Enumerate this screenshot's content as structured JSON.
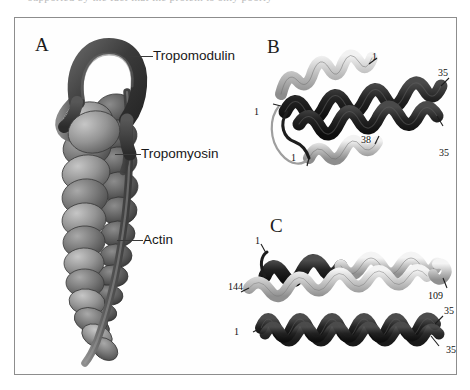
{
  "page": {
    "top_cut_text": "supported by the fact that the protein is only poorly",
    "background_color": "#ffffff",
    "frame_border_color": "#8d8d8d"
  },
  "figure": {
    "panels": [
      {
        "id": "A",
        "letter": "A",
        "description": "Actin filament capped by tropomodulin with tropomyosin strand",
        "callouts": [
          {
            "name": "tropomodulin",
            "label": "Tropomodulin"
          },
          {
            "name": "tropomyosin",
            "label": "Tropomyosin"
          },
          {
            "name": "actin",
            "label": "Actin"
          }
        ]
      },
      {
        "id": "B",
        "letter": "B",
        "description": "Coiled-coil ribbon model, N-terminal region",
        "residue_labels": [
          {
            "name": "b-top-helix-start",
            "text": "1"
          },
          {
            "name": "b-left-chain-start",
            "text": "1"
          },
          {
            "name": "b-lower-helix-start",
            "text": "1"
          },
          {
            "name": "b-lower-helix-end",
            "text": "38"
          },
          {
            "name": "b-upper-right-end",
            "text": "35"
          },
          {
            "name": "b-lower-right-end",
            "text": "35"
          }
        ]
      },
      {
        "id": "C",
        "letter": "C",
        "description": "Coiled-coil ribbon model, second construct",
        "residue_labels": [
          {
            "name": "c-upper-left-start",
            "text": "1"
          },
          {
            "name": "c-upper-left-end",
            "text": "144"
          },
          {
            "name": "c-upper-right-end",
            "text": "109"
          },
          {
            "name": "c-lower-left-start",
            "text": "1"
          },
          {
            "name": "c-lower-right-upper",
            "text": "35"
          },
          {
            "name": "c-lower-right-lower",
            "text": "35"
          }
        ]
      }
    ],
    "colors": {
      "dark_ribbon": "#232323",
      "light_ribbon": "#d4d4d4",
      "actin_mid": "#6f6f6f",
      "actin_dark": "#4a4a4a",
      "tropomodulin": "#3d3d3d",
      "leader_line": "#3a3a3a",
      "text": "#181818"
    }
  }
}
